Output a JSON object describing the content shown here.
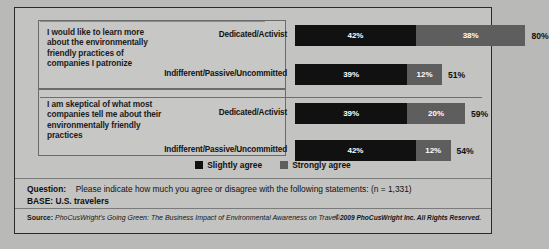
{
  "chart_data": {
    "type": "bar",
    "orientation": "horizontal",
    "stacked": true,
    "title": "",
    "xlabel": "",
    "ylabel": "",
    "xlim": [
      0,
      80
    ],
    "grid": false,
    "legend_position": "bottom-center",
    "statements": [
      {
        "text": "I would like to learn more about the environmentally friendly practices of companies I patronize",
        "rows": [
          0,
          1
        ]
      },
      {
        "text": "I am skeptical of what most companies tell me about their environmentally friendly practices",
        "rows": [
          2,
          3
        ]
      }
    ],
    "categories": [
      "Dedicated/Activist",
      "Indifferent/Passive/Uncommitted",
      "Dedicated/Activist",
      "Indifferent/Passive/Uncommitted"
    ],
    "series": [
      {
        "name": "Slightly agree",
        "color": "#111111",
        "values": [
          42,
          39,
          39,
          42
        ]
      },
      {
        "name": "Strongly agree",
        "color": "#5e5e5e",
        "values": [
          38,
          12,
          20,
          12
        ]
      }
    ],
    "totals": [
      80,
      51,
      59,
      54
    ],
    "value_labels": [
      {
        "slightly": "42%",
        "strongly": "38%",
        "total": "80%"
      },
      {
        "slightly": "39%",
        "strongly": "12%",
        "total": "51%"
      },
      {
        "slightly": "39%",
        "strongly": "20%",
        "total": "59%"
      },
      {
        "slightly": "42%",
        "strongly": "12%",
        "total": "54%"
      }
    ]
  },
  "legend": {
    "items": [
      {
        "label": "Slightly agree",
        "color": "#111111"
      },
      {
        "label": "Strongly agree",
        "color": "#5e5e5e"
      }
    ]
  },
  "footer": {
    "question_label": "Question:",
    "question_text": "Please indicate how much you agree or disagree with the following statements: (n = 1,331)",
    "base": "BASE: U.S. travelers",
    "source_label": "Source:",
    "source_text": "PhoCusWright's Going Green: The Business Impact of Environmental Awareness on Travel",
    "copyright": "©2009 PhoCusWright Inc. All Rights Reserved."
  }
}
